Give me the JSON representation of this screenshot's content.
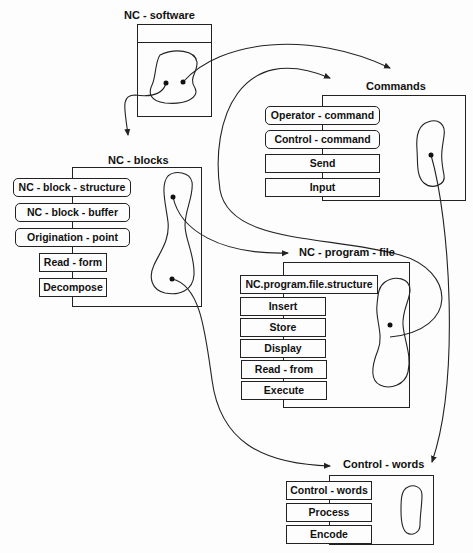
{
  "diagram": {
    "classes": [
      {
        "id": "nc-software",
        "title": "NC - software",
        "operations": []
      },
      {
        "id": "commands",
        "title": "Commands",
        "operations": [
          {
            "label": "Operator - command",
            "style": "rounded"
          },
          {
            "label": "Control - command",
            "style": "rounded"
          },
          {
            "label": "Send",
            "style": "square"
          },
          {
            "label": "Input",
            "style": "square"
          }
        ]
      },
      {
        "id": "nc-blocks",
        "title": "NC - blocks",
        "operations": [
          {
            "label": "NC - block - structure",
            "style": "rounded"
          },
          {
            "label": "NC - block - buffer",
            "style": "rounded"
          },
          {
            "label": "Origination - point",
            "style": "rounded"
          },
          {
            "label": "Read - form",
            "style": "square"
          },
          {
            "label": "Decompose",
            "style": "square"
          }
        ]
      },
      {
        "id": "nc-program-file",
        "title": "NC - program - file",
        "operations": [
          {
            "label": "NC.program.file.structure",
            "style": "square"
          },
          {
            "label": "Insert",
            "style": "square"
          },
          {
            "label": "Store",
            "style": "square"
          },
          {
            "label": "Display",
            "style": "square"
          },
          {
            "label": "Read - from",
            "style": "square"
          },
          {
            "label": "Execute",
            "style": "square"
          }
        ]
      },
      {
        "id": "control-words",
        "title": "Control - words",
        "operations": [
          {
            "label": "Control - words",
            "style": "square"
          },
          {
            "label": "Process",
            "style": "square"
          },
          {
            "label": "Encode",
            "style": "square"
          }
        ]
      }
    ],
    "connections": [
      {
        "from": "nc-software",
        "to": "commands"
      },
      {
        "from": "nc-software",
        "to": "nc-blocks"
      },
      {
        "from": "commands",
        "to": "control-words"
      },
      {
        "from": "nc-blocks",
        "to": "nc-program-file"
      },
      {
        "from": "nc-blocks",
        "to": "control-words"
      },
      {
        "from": "nc-program-file",
        "to": "commands"
      }
    ],
    "colors": {
      "line": "#222222",
      "background": "#fdfdfd"
    }
  }
}
